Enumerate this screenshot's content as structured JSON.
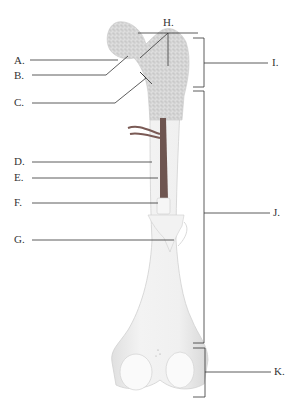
{
  "diagram": {
    "labels": {
      "A": "A.",
      "B": "B.",
      "C": "C.",
      "D": "D.",
      "E": "E.",
      "F": "F.",
      "G": "G.",
      "H": "H.",
      "I": "I.",
      "J": "J.",
      "K": "K."
    },
    "left_labels": [
      "A",
      "B",
      "C",
      "D",
      "E",
      "F",
      "G"
    ],
    "top_labels": [
      "H"
    ],
    "right_bracket_labels": [
      "I",
      "J",
      "K"
    ],
    "colors": {
      "bone_spongy": "#d9d9d9",
      "bone_shaft": "#eeeeee",
      "medullary_cavity": "#7a5a55",
      "leader_line": "#333333",
      "text": "#333333"
    }
  }
}
